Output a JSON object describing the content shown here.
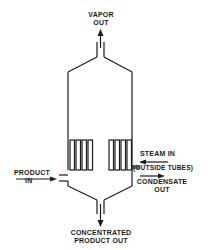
{
  "diagram": {
    "type": "evaporator-schematic",
    "colors": {
      "line": "#1a1a1a",
      "background": "#ffffff"
    },
    "labels": {
      "vapor_out": [
        "VAPOR",
        "OUT"
      ],
      "steam_in": "STEAM IN",
      "outside_tubes": "(OUTSIDE TUBES)",
      "condensate_out": [
        "CONDENSATE",
        "OUT"
      ],
      "product_in": [
        "PRODUCT",
        "IN"
      ],
      "concentrated_product_out": [
        "CONCENTRATED",
        "PRODUCT OUT"
      ]
    },
    "flows": [
      {
        "name": "vapor-out",
        "direction": "up"
      },
      {
        "name": "steam-in",
        "direction": "left"
      },
      {
        "name": "condensate-out",
        "direction": "right"
      },
      {
        "name": "product-in",
        "direction": "right"
      },
      {
        "name": "concentrated-product-out",
        "direction": "down"
      }
    ],
    "tube_bundles": {
      "left_tubes": 4,
      "right_tubes": 4
    }
  }
}
